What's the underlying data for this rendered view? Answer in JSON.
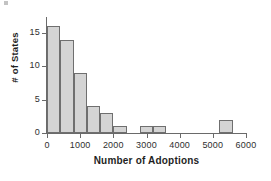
{
  "chart_data": {
    "type": "bar",
    "title": "",
    "subtitle": "",
    "xlabel": "Number of Adoptions",
    "ylabel": "# of States",
    "xlim": [
      0,
      6000
    ],
    "ylim": [
      0,
      17.4
    ],
    "xticks": [
      0,
      1000,
      2000,
      3000,
      4000,
      5000,
      6000
    ],
    "xtick_labels": [
      "0",
      "1000",
      "2000",
      "3000",
      "4000",
      "5000",
      "6000"
    ],
    "yticks": [
      0,
      5,
      10,
      15
    ],
    "ytick_labels": [
      "0",
      "5",
      "10",
      "15"
    ],
    "grid": false,
    "legend": null,
    "bin_width": 400,
    "bar_fill": "#d4d4d4",
    "bar_edge": "#6f6f6f",
    "axis_color": "#6a6a6a",
    "bins": [
      {
        "label": "0-400",
        "x0": 0,
        "x1": 400,
        "value": 16
      },
      {
        "label": "400-800",
        "x0": 400,
        "x1": 800,
        "value": 14
      },
      {
        "label": "800-1200",
        "x0": 800,
        "x1": 1200,
        "value": 9
      },
      {
        "label": "1200-1600",
        "x0": 1200,
        "x1": 1600,
        "value": 4
      },
      {
        "label": "1600-2000",
        "x0": 1600,
        "x1": 2000,
        "value": 3
      },
      {
        "label": "2000-2400",
        "x0": 2000,
        "x1": 2400,
        "value": 1
      },
      {
        "label": "2800-3200",
        "x0": 2800,
        "x1": 3200,
        "value": 1
      },
      {
        "label": "3200-3600",
        "x0": 3200,
        "x1": 3600,
        "value": 1
      },
      {
        "label": "5200-5600",
        "x0": 5200,
        "x1": 5600,
        "value": 2
      }
    ],
    "categories": [
      "0-400",
      "400-800",
      "800-1200",
      "1200-1600",
      "1600-2000",
      "2000-2400",
      "2800-3200",
      "3200-3600",
      "5200-5600"
    ],
    "values": [
      16,
      14,
      9,
      4,
      3,
      1,
      1,
      1,
      2
    ]
  }
}
